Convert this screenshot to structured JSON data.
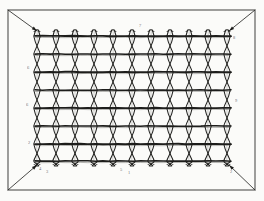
{
  "figure": {
    "kind": "woven-wire-mesh-fabric",
    "title": "",
    "caption": "",
    "colors": {
      "paper": "#fbfbf9",
      "ink": "#1d1d1b",
      "ink_light": "#4a4a46",
      "frame": "#2a2a28",
      "label": "#3a3a38"
    },
    "frame": {
      "outer": {
        "x": 8,
        "y": 10,
        "width": 247,
        "height": 180
      },
      "corner_diagonals": 4
    },
    "mesh": {
      "top_left": {
        "x": 37,
        "y": 31
      },
      "top_right": {
        "x": 229,
        "y": 31
      },
      "bottom_right": {
        "x": 229,
        "y": 165
      },
      "bottom_left": {
        "x": 37,
        "y": 165
      },
      "vertical_strand_count": 11,
      "horizontal_wire_count": 8,
      "vertical_x": [
        37,
        56,
        75,
        94,
        113,
        132,
        151,
        170,
        189,
        208,
        227
      ],
      "horizontal_y": [
        36,
        54,
        72,
        90,
        108,
        126,
        144,
        161
      ],
      "strand_style": "twisted-double-helix",
      "strand_gap": 6.5
    },
    "labels": [
      {
        "id": "l1",
        "text": "6",
        "x": 27,
        "y": 66
      },
      {
        "id": "l2",
        "text": "6",
        "x": 26,
        "y": 103
      },
      {
        "id": "l3",
        "text": "2",
        "x": 28,
        "y": 141
      },
      {
        "id": "l4",
        "text": "4",
        "x": 39,
        "y": 167
      },
      {
        "id": "l5",
        "text": "3",
        "x": 46,
        "y": 170
      },
      {
        "id": "l6",
        "text": "5",
        "x": 120,
        "y": 168
      },
      {
        "id": "l7",
        "text": "1",
        "x": 128,
        "y": 171
      },
      {
        "id": "l8",
        "text": "7",
        "x": 139,
        "y": 24
      },
      {
        "id": "l9",
        "text": "8",
        "x": 233,
        "y": 36
      },
      {
        "id": "l10",
        "text": "9",
        "x": 235,
        "y": 99
      },
      {
        "id": "l11",
        "text": "2",
        "x": 230,
        "y": 170
      }
    ]
  }
}
